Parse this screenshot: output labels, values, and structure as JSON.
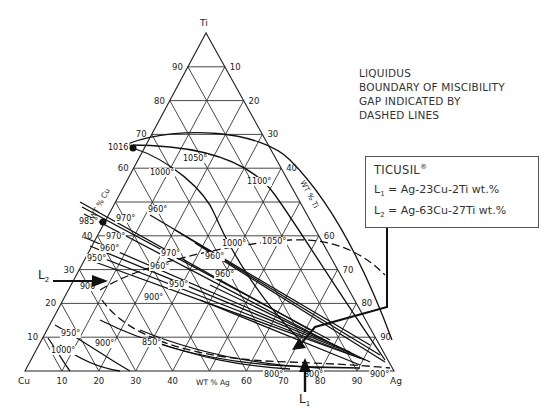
{
  "diagram": {
    "vertices": {
      "top": "Ti",
      "left": "Cu",
      "right": "Ag"
    },
    "axis_names": {
      "left": "WT % Cu",
      "right": "WT % Ti",
      "bottom": "WT % Ag"
    },
    "ti_ticks_left": [
      "10",
      "20",
      "30",
      "40",
      "50",
      "60",
      "70",
      "80",
      "90"
    ],
    "ti_ticks_right": [
      "90",
      "80",
      "70",
      "60",
      "50",
      "40",
      "30",
      "20",
      "10"
    ],
    "ag_ticks_bottom": [
      "10",
      "20",
      "30",
      "40",
      "50",
      "60",
      "70",
      "80",
      "90"
    ],
    "visible_left_ticks": [
      "10",
      "20",
      "30",
      "40",
      "60",
      "70",
      "80",
      "90"
    ],
    "visible_right_ticks": [
      "90",
      "80",
      "70",
      "60",
      "40",
      "30",
      "20",
      "10"
    ],
    "visible_bottom_ticks": [
      "10",
      "20",
      "30",
      "40",
      "60",
      "70",
      "80",
      "90"
    ],
    "temperature_labels": [
      {
        "text": "1016°",
        "x": 108,
        "y": 150
      },
      {
        "text": "1050°",
        "x": 183,
        "y": 161
      },
      {
        "text": "1000°",
        "x": 150,
        "y": 175
      },
      {
        "text": "1100°",
        "x": 247,
        "y": 184
      },
      {
        "text": "960°",
        "x": 148,
        "y": 212
      },
      {
        "text": "970°",
        "x": 116,
        "y": 221
      },
      {
        "text": "985°",
        "x": 79,
        "y": 224
      },
      {
        "text": "970°",
        "x": 106,
        "y": 239
      },
      {
        "text": "960°",
        "x": 100,
        "y": 251
      },
      {
        "text": "950°",
        "x": 87,
        "y": 261
      },
      {
        "text": "970°",
        "x": 161,
        "y": 256
      },
      {
        "text": "1000°",
        "x": 222,
        "y": 246
      },
      {
        "text": "1050°",
        "x": 262,
        "y": 244
      },
      {
        "text": "960°",
        "x": 205,
        "y": 259
      },
      {
        "text": "960°",
        "x": 150,
        "y": 269
      },
      {
        "text": "960°",
        "x": 215,
        "y": 277
      },
      {
        "text": "950°",
        "x": 169,
        "y": 287
      },
      {
        "text": "900°",
        "x": 80,
        "y": 289
      },
      {
        "text": "900°",
        "x": 144,
        "y": 300
      },
      {
        "text": "950°",
        "x": 61,
        "y": 336
      },
      {
        "text": "900°",
        "x": 95,
        "y": 346
      },
      {
        "text": "850°",
        "x": 142,
        "y": 345
      },
      {
        "text": "1000°",
        "x": 51,
        "y": 353
      },
      {
        "text": "800°",
        "x": 264,
        "y": 377
      },
      {
        "text": "800°",
        "x": 304,
        "y": 377
      },
      {
        "text": "900°",
        "x": 370,
        "y": 377
      }
    ]
  },
  "legend": {
    "lines": [
      "LIQUIDUS",
      "BOUNDARY OF MISCIBILITY",
      "GAP INDICATED BY",
      "DASHED LINES"
    ]
  },
  "callout": {
    "title": "TICUSIL",
    "title_mark": "®",
    "l1_label": "L",
    "l1_sub": "1",
    "l1_value": "= Ag-23Cu-2Ti wt.%",
    "l2_label": "L",
    "l2_sub": "2",
    "l2_value": "= Ag-63Cu-27Ti wt.%"
  },
  "markers": {
    "l1": {
      "label": "L",
      "sub": "1"
    },
    "l2": {
      "label": "L",
      "sub": "2"
    }
  },
  "chart_data": {
    "type": "ternary",
    "components": [
      "Ag",
      "Cu",
      "Ti"
    ],
    "axis_labels": {
      "Cu": "WT % Cu",
      "Ti": "WT % Ti",
      "Ag": "WT % Ag"
    },
    "grid_step": 10,
    "points": [
      {
        "name": "L1",
        "Ag": 75,
        "Cu": 23,
        "Ti": 2
      },
      {
        "name": "L2",
        "Ag": 10,
        "Cu": 63,
        "Ti": 27
      }
    ],
    "isotherms_C": [
      1100,
      1050,
      1016,
      1000,
      985,
      970,
      960,
      950,
      900,
      850,
      800
    ]
  }
}
